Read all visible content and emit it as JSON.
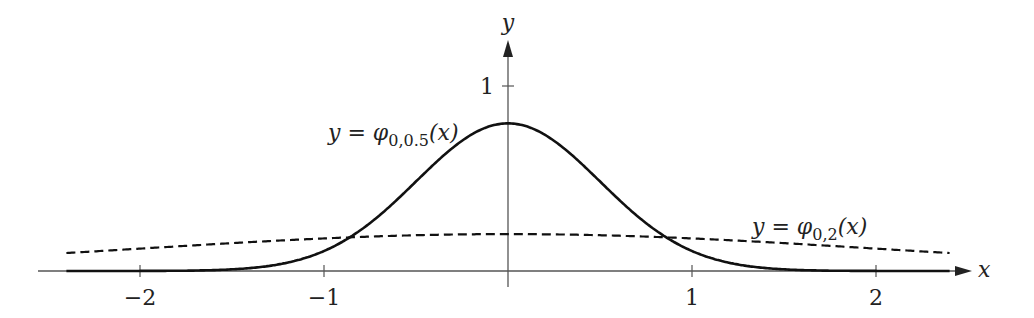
{
  "chart_data": {
    "type": "line",
    "title": "",
    "xlabel": "x",
    "ylabel": "y",
    "xlim": [
      -2.5,
      2.5
    ],
    "ylim": [
      0,
      1.25
    ],
    "grid": false,
    "x_ticks": [
      -2,
      -1,
      1,
      2
    ],
    "x_tick_labels": [
      "−2",
      "−1",
      "1",
      "2"
    ],
    "y_ticks": [
      1
    ],
    "y_tick_labels": [
      "1"
    ],
    "series": [
      {
        "name": "y = φ_{0,0.5}(x)",
        "label_main": "y = φ",
        "label_sub": "0,0.5",
        "label_tail": "(x)",
        "style": "solid",
        "mu": 0,
        "sigma": 0.5,
        "peak": 0.798
      },
      {
        "name": "y = φ_{0,2}(x)",
        "label_main": "y = φ",
        "label_sub": "0,2",
        "label_tail": "(x)",
        "style": "dashed",
        "mu": 0,
        "sigma": 2,
        "peak": 0.199
      }
    ],
    "legend_position": "inline annotations"
  },
  "axes": {
    "x_label": "x",
    "y_label": "y",
    "origin_px": [
      508,
      271
    ],
    "px_per_unit_x": 184,
    "px_per_unit_y": 185
  }
}
